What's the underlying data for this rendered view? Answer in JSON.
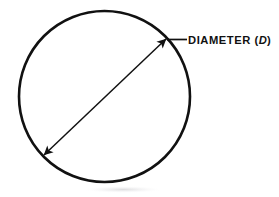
{
  "figure": {
    "type": "geometry-diagram",
    "background_color": "#ffffff",
    "stroke_color": "#111111",
    "width": 279,
    "height": 197
  },
  "circle": {
    "name": "circle-outline",
    "center_x": 104.5,
    "center_y": 96.5,
    "radius": 85.5,
    "stroke_width": 2.6,
    "stroke_color": "#111111",
    "fill": "none"
  },
  "diameter": {
    "label_prefix": "DIAMETER (",
    "label_variable": "D",
    "label_suffix": ")",
    "label_full": "DIAMETER (D)",
    "stroke_width": 1.5,
    "stroke_color": "#111111",
    "start_x": 44,
    "start_y": 155,
    "end_x": 166,
    "end_y": 39,
    "arrowheads": "both-ends"
  },
  "leader": {
    "name": "leader-line",
    "x1": 167,
    "y1": 39.5,
    "x2": 187,
    "y2": 39.5,
    "stroke_width": 1.6
  },
  "label_position": {
    "text_x": 188,
    "text_y": 43.5
  }
}
